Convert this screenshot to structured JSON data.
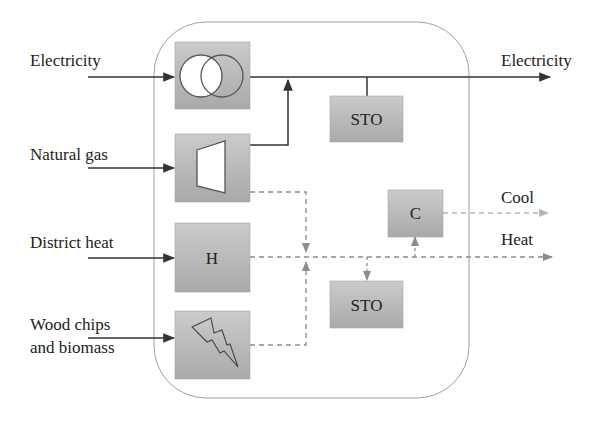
{
  "diagram": {
    "inputs": [
      {
        "id": "electricity-in",
        "label": "Electricity",
        "lines": [
          "Electricity"
        ]
      },
      {
        "id": "natural-gas-in",
        "label": "Natural gas",
        "lines": [
          "Natural gas"
        ]
      },
      {
        "id": "district-heat-in",
        "label": "District heat",
        "lines": [
          "District heat"
        ]
      },
      {
        "id": "wood-chips-in",
        "label": "Wood chips and biomass",
        "lines": [
          "Wood chips",
          "and biomass"
        ]
      }
    ],
    "outputs": [
      {
        "id": "electricity-out",
        "label": "Electricity"
      },
      {
        "id": "cool-out",
        "label": "Cool"
      },
      {
        "id": "heat-out",
        "label": "Heat"
      }
    ],
    "components": [
      {
        "id": "transformer",
        "label": "",
        "icon": "transformer-icon"
      },
      {
        "id": "gas-turbine",
        "label": "",
        "icon": "turbine-icon"
      },
      {
        "id": "heat-exchanger",
        "label": "H",
        "icon": ""
      },
      {
        "id": "biomass-boiler",
        "label": "",
        "icon": "lightning-icon"
      },
      {
        "id": "electric-storage",
        "label": "STO",
        "icon": ""
      },
      {
        "id": "chiller",
        "label": "C",
        "icon": ""
      },
      {
        "id": "thermal-storage",
        "label": "STO",
        "icon": ""
      }
    ],
    "colors": {
      "box_fill": "#b3b3b3",
      "box_fill_light": "#cfcfcf",
      "electric_line": "#333333",
      "thermal_line": "#8c8c8c",
      "cool_line": "#b5b5b5",
      "container_stroke": "#9a9a9a"
    }
  }
}
